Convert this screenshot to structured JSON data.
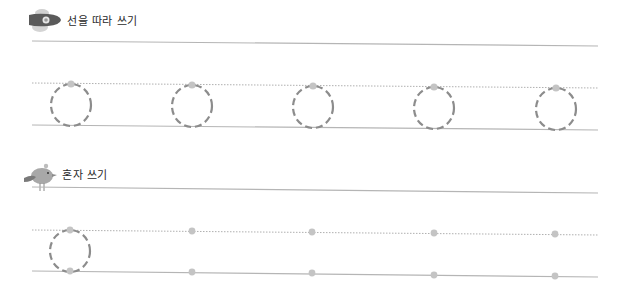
{
  "sections": [
    {
      "id": "trace",
      "title": "선을 따라 쓰기",
      "icon": "rocket-icon",
      "top_line": {
        "y_left": 41,
        "y_right": 46
      },
      "mid_line": {
        "y_left": 83,
        "y_right": 88
      },
      "base_line": {
        "y_left": 125,
        "y_right": 130
      },
      "circles": [
        {
          "cx": 71,
          "cy": 105
        },
        {
          "cx": 192,
          "cy": 106
        },
        {
          "cx": 313,
          "cy": 107
        },
        {
          "cx": 434,
          "cy": 108
        },
        {
          "cx": 556,
          "cy": 109
        }
      ]
    },
    {
      "id": "self",
      "title": "혼자 쓰기",
      "icon": "bird-icon",
      "top_line": {
        "y_left": 187,
        "y_right": 193
      },
      "mid_line": {
        "y_left": 230,
        "y_right": 235
      },
      "base_line": {
        "y_left": 271,
        "y_right": 277
      },
      "circles": [
        {
          "cx": 70,
          "cy": 251
        }
      ],
      "dots": [
        {
          "x": 70,
          "top_y": 230,
          "bottom_y": 271
        },
        {
          "x": 192,
          "top_y": 231,
          "bottom_y": 272
        },
        {
          "x": 312,
          "top_y": 232,
          "bottom_y": 273
        },
        {
          "x": 434,
          "top_y": 233,
          "bottom_y": 275
        },
        {
          "x": 555,
          "top_y": 234,
          "bottom_y": 276
        }
      ]
    }
  ],
  "layout": {
    "line_x_start": 32,
    "line_x_end": 598,
    "circle_rx": 20,
    "circle_ry": 21
  },
  "colors": {
    "solid_line": "#b5b5b5",
    "dotted_line": "#b0b0b0",
    "circle_stroke": "#8c8c8c",
    "dot_fill": "#c4c4c4",
    "title_text": "#2a2a2a"
  }
}
